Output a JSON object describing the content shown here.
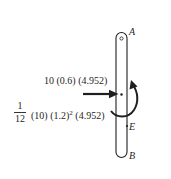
{
  "diagram": {
    "type": "free-body / kinetic diagram of a rod",
    "points": {
      "A": "A",
      "B": "B",
      "E": "E"
    },
    "force_label": "10 (0.6) (4.952)",
    "moment_label": {
      "fraction_numerator": "1",
      "fraction_denominator": "12",
      "mass": "(10)",
      "length_base": "(1.2)",
      "length_exponent": "2",
      "alpha": "(4.952)"
    },
    "colors": {
      "line": "#1f1f1f",
      "background": "#ffffff"
    }
  }
}
